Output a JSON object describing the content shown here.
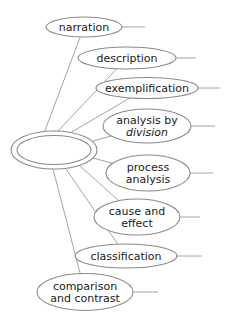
{
  "diagram": {
    "type": "cluster-map",
    "center": {
      "label": ""
    },
    "nodes": [
      {
        "id": "narration",
        "lines": [
          "narration"
        ]
      },
      {
        "id": "description",
        "lines": [
          "description"
        ]
      },
      {
        "id": "exemplification",
        "lines": [
          "exemplification"
        ]
      },
      {
        "id": "analysis-by-division",
        "lines": [
          "analysis by",
          "division"
        ]
      },
      {
        "id": "process-analysis",
        "lines": [
          "process",
          "analysis"
        ]
      },
      {
        "id": "cause-and-effect",
        "lines": [
          "cause and",
          "effect"
        ]
      },
      {
        "id": "classification",
        "lines": [
          "classification"
        ]
      },
      {
        "id": "comparison-and-contrast",
        "lines": [
          "comparison",
          "and contrast"
        ]
      }
    ],
    "colors": {
      "stroke": "#8a8a8a",
      "text": "#1a1a1a",
      "background": "#ffffff"
    }
  }
}
